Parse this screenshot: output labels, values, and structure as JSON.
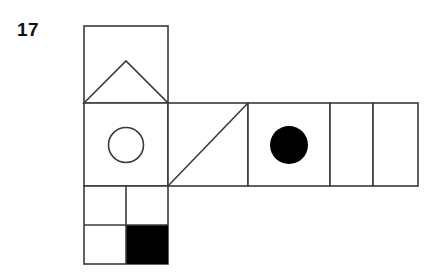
{
  "page": {
    "background_color": "#ffffff",
    "width": 436,
    "height": 273
  },
  "item": {
    "number_label": "17",
    "label_color": "#111111"
  },
  "figure": {
    "name": "cube-net-diagram",
    "stroke_color": "#3a3a3a",
    "fill_color": "#000000",
    "blank_fill": "#ffffff",
    "stroke_width": 1.6,
    "cell_size": 84,
    "faces": [
      {
        "name": "face-triangle",
        "symbol": "triangle-outline",
        "x": 84,
        "y": 26,
        "width": 84,
        "height": 77,
        "fill": "#ffffff"
      },
      {
        "name": "face-circle-outline",
        "symbol": "circle-outline",
        "x": 84,
        "y": 103,
        "width": 84,
        "height": 83,
        "fill": "#ffffff"
      },
      {
        "name": "face-diagonal",
        "symbol": "diagonal-line",
        "x": 168,
        "y": 103,
        "width": 80,
        "height": 83,
        "fill": "#ffffff"
      },
      {
        "name": "face-circle-filled",
        "symbol": "circle-filled",
        "x": 248,
        "y": 103,
        "width": 82,
        "height": 83,
        "fill": "#ffffff"
      },
      {
        "name": "face-blank-1",
        "symbol": "blank",
        "x": 330,
        "y": 103,
        "width": 43,
        "height": 83,
        "fill": "#ffffff"
      },
      {
        "name": "face-blank-2",
        "symbol": "blank",
        "x": 373,
        "y": 103,
        "width": 45,
        "height": 83,
        "fill": "#ffffff"
      },
      {
        "name": "face-quartered",
        "symbol": "quarter-filled-bottom-right",
        "x": 84,
        "y": 186,
        "width": 84,
        "height": 78,
        "fill": "#ffffff"
      }
    ],
    "shapes": {
      "triangle": {
        "name": "triangle-outline",
        "points": "84,103 126,61 168,103"
      },
      "circle_outline": {
        "name": "circle-outline",
        "cx": 126,
        "cy": 145,
        "r": 17.5
      },
      "diagonal": {
        "name": "diagonal-line",
        "x1": 168,
        "y1": 186,
        "x2": 248,
        "y2": 103
      },
      "circle_filled": {
        "name": "circle-filled",
        "cx": 289,
        "cy": 145,
        "r": 19
      },
      "quarter_block": {
        "name": "quarter-filled-bottom-right",
        "x": 126,
        "y": 225,
        "width": 42,
        "height": 39
      }
    }
  }
}
